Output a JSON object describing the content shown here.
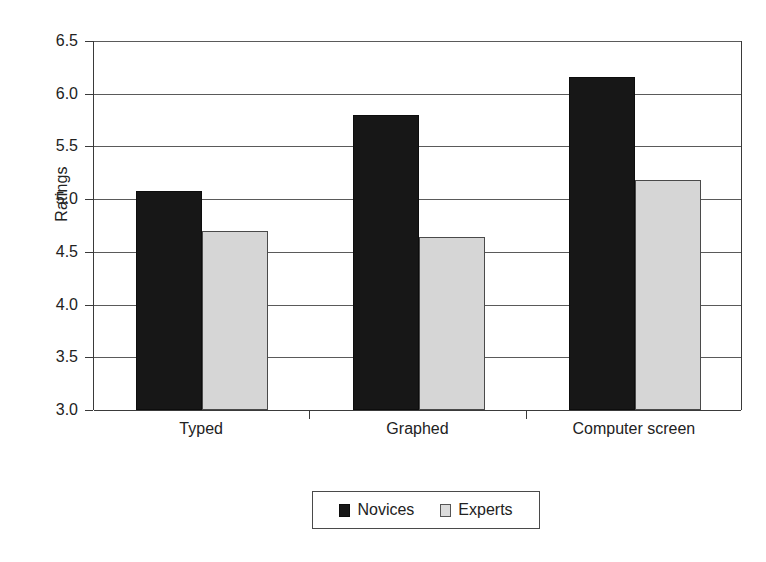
{
  "chart_data": {
    "type": "bar",
    "title": "",
    "subtitle": "",
    "xlabel": "",
    "ylabel": "Ratings",
    "categories": [
      "Typed",
      "Graphed",
      "Computer screen"
    ],
    "series": [
      {
        "name": "Novices",
        "color": "#171717",
        "values": [
          5.08,
          5.8,
          6.16
        ]
      },
      {
        "name": "Experts",
        "color": "#d6d6d6",
        "values": [
          4.7,
          4.64,
          5.18
        ]
      }
    ],
    "ylim": [
      3.0,
      6.5
    ],
    "ytick_labels": [
      "3.0",
      "3.5",
      "4.0",
      "4.5",
      "5.0",
      "5.5",
      "6.0",
      "6.5"
    ],
    "ytick_values": [
      3.0,
      3.5,
      4.0,
      4.5,
      5.0,
      5.5,
      6.0,
      6.5
    ],
    "grid": true,
    "legend_position": "bottom-center",
    "legend_entries": [
      "Novices",
      "Experts"
    ]
  },
  "axes": {
    "y_label": "Ratings",
    "y_ticks": [
      {
        "label": "6.5",
        "value": 6.5
      },
      {
        "label": "6.0",
        "value": 6.0
      },
      {
        "label": "5.5",
        "value": 5.5
      },
      {
        "label": "5.0",
        "value": 5.0
      },
      {
        "label": "4.5",
        "value": 4.5
      },
      {
        "label": "4.0",
        "value": 4.0
      },
      {
        "label": "3.5",
        "value": 3.5
      },
      {
        "label": "3.0",
        "value": 3.0
      }
    ],
    "categories": [
      {
        "label": "Typed"
      },
      {
        "label": "Graphed"
      },
      {
        "label": "Computer screen"
      }
    ]
  },
  "legend": {
    "items": [
      {
        "label": "Novices",
        "swatch": "black-swatch-icon"
      },
      {
        "label": "Experts",
        "swatch": "light-gray-swatch-icon"
      }
    ]
  },
  "colors": {
    "novices": "#171717",
    "experts": "#d6d6d6",
    "axis": "#3a3a3a",
    "grid": "#5a5a5a",
    "background": "#ffffff"
  }
}
